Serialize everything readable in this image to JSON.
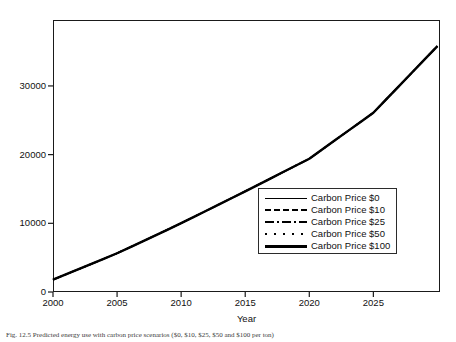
{
  "figure": {
    "background_color": "#ffffff",
    "axis_color": "#1a1a1a",
    "line_color": "#000000",
    "caption_prefix": "Fig. 12.5",
    "caption_text": "Fig. 12.5  Predicted energy use with carbon price scenarios ($0, $10, $25, $50 and $100 per ton)"
  },
  "chart_data": {
    "type": "line",
    "title": "",
    "xlabel": "Year",
    "ylabel": "",
    "xlim": [
      2000,
      2030.2
    ],
    "ylim": [
      0,
      39600
    ],
    "xticks": [
      2000,
      2005,
      2010,
      2015,
      2020,
      2025
    ],
    "xtick_labels": [
      "2000",
      "2005",
      "2010",
      "2015",
      "2020",
      "2025"
    ],
    "yticks": [
      0,
      10000,
      20000,
      30000
    ],
    "ytick_labels": [
      "0",
      "10000",
      "20000",
      "30000"
    ],
    "grid": false,
    "legend_position": "lower right",
    "x": [
      2000,
      2001,
      2002,
      2003,
      2004,
      2005,
      2006,
      2007,
      2008,
      2009,
      2010,
      2011,
      2012,
      2013,
      2014,
      2015,
      2016,
      2017,
      2018,
      2019,
      2020,
      2021,
      2022,
      2023,
      2024,
      2025,
      2026,
      2027,
      2028,
      2029,
      2030
    ],
    "series": [
      {
        "name": "Carbon Price $0",
        "style": "solid-thin",
        "color": "#000000",
        "values": [
          1800,
          2560,
          3320,
          4090,
          4860,
          5640,
          6500,
          7370,
          8250,
          9130,
          10020,
          10940,
          11860,
          12790,
          13720,
          14660,
          15600,
          16550,
          17500,
          18450,
          19400,
          20740,
          22080,
          23420,
          24760,
          26100,
          28040,
          29980,
          31920,
          33860,
          35800
        ]
      },
      {
        "name": "Carbon Price $10",
        "style": "dashed",
        "color": "#000000",
        "values": [
          1800,
          2560,
          3320,
          4090,
          4860,
          5640,
          6500,
          7370,
          8250,
          9130,
          10020,
          10940,
          11860,
          12790,
          13720,
          14660,
          15600,
          16550,
          17500,
          18450,
          19400,
          20740,
          22080,
          23420,
          24760,
          26100,
          28040,
          29980,
          31920,
          33860,
          35800
        ]
      },
      {
        "name": "Carbon Price $25",
        "style": "dash-dot",
        "color": "#000000",
        "values": [
          1800,
          2560,
          3320,
          4090,
          4860,
          5640,
          6500,
          7370,
          8250,
          9130,
          10020,
          10940,
          11860,
          12790,
          13720,
          14660,
          15600,
          16550,
          17500,
          18450,
          19400,
          20740,
          22080,
          23420,
          24760,
          26100,
          28040,
          29980,
          31920,
          33860,
          35800
        ]
      },
      {
        "name": "Carbon Price $50",
        "style": "dotted",
        "color": "#000000",
        "values": [
          1800,
          2560,
          3320,
          4090,
          4860,
          5640,
          6500,
          7370,
          8250,
          9130,
          10020,
          10940,
          11860,
          12790,
          13720,
          14660,
          15600,
          16550,
          17500,
          18450,
          19400,
          20740,
          22080,
          23420,
          24760,
          26100,
          28040,
          29980,
          31920,
          33860,
          35800
        ]
      },
      {
        "name": "Carbon Price $100",
        "style": "solid-thick",
        "color": "#000000",
        "values": [
          1800,
          2560,
          3320,
          4090,
          4860,
          5640,
          6500,
          7370,
          8250,
          9130,
          10020,
          10940,
          11860,
          12790,
          13720,
          14660,
          15600,
          16550,
          17500,
          18450,
          19400,
          20740,
          22080,
          23420,
          24760,
          26100,
          28040,
          29980,
          31920,
          33860,
          35800
        ]
      }
    ]
  },
  "legend": {
    "entries": [
      {
        "label": "Carbon Price $0",
        "style": "solid-thin"
      },
      {
        "label": "Carbon Price $10",
        "style": "dashed"
      },
      {
        "label": "Carbon Price $25",
        "style": "dash-dot"
      },
      {
        "label": "Carbon Price $50",
        "style": "dotted"
      },
      {
        "label": "Carbon Price $100",
        "style": "solid-thick"
      }
    ]
  }
}
